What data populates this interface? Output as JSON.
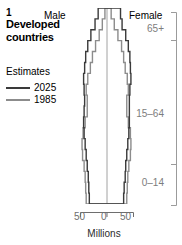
{
  "figure": {
    "number": "1",
    "title": "Developed countries"
  },
  "legend": {
    "title": "Estimates",
    "items": [
      {
        "label": "2025",
        "color": "#3a3a3a"
      },
      {
        "label": "1985",
        "color": "#8c8c8c"
      }
    ]
  },
  "axes": {
    "left_side_label": "Male",
    "right_side_label": "Female",
    "x_title": "Millions",
    "x_ticks": [
      "50",
      "0",
      "50"
    ],
    "age_groups": [
      "65+",
      "15–64",
      "0–14"
    ]
  },
  "chart_data": {
    "type": "bar",
    "subtype": "population-pyramid",
    "title": "Developed countries",
    "xlabel": "Millions",
    "ylabel": "",
    "xlim": [
      -50,
      50
    ],
    "grid": false,
    "legend_position": "left",
    "age_bands": [
      "0-4",
      "5-9",
      "10-14",
      "15-19",
      "20-24",
      "25-29",
      "30-34",
      "35-39",
      "40-44",
      "45-49",
      "50-54",
      "55-59",
      "60-64",
      "65-69",
      "70-74",
      "75-79",
      "80-84",
      "85+"
    ],
    "age_group_breaks": [
      "0–14",
      "15–64",
      "65+"
    ],
    "series": [
      {
        "name": "2025",
        "color": "#3a3a3a",
        "male": [
          34,
          35,
          36,
          38,
          40,
          42,
          44,
          45,
          44,
          43,
          44,
          45,
          43,
          41,
          37,
          31,
          23,
          17
        ],
        "female": [
          32,
          33,
          35,
          36,
          38,
          40,
          42,
          43,
          43,
          43,
          44,
          46,
          45,
          44,
          41,
          36,
          29,
          26
        ]
      },
      {
        "name": "1985",
        "color": "#8c8c8c",
        "male": [
          40,
          41,
          42,
          44,
          47,
          48,
          46,
          42,
          38,
          38,
          40,
          37,
          32,
          28,
          22,
          15,
          9,
          4
        ],
        "female": [
          38,
          39,
          40,
          42,
          45,
          46,
          45,
          41,
          38,
          38,
          41,
          39,
          35,
          32,
          28,
          21,
          14,
          8
        ]
      }
    ]
  }
}
